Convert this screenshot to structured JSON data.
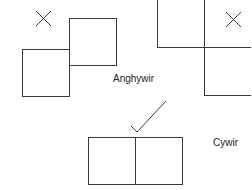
{
  "labels": {
    "incorrect": "Anghywir",
    "correct": "Cywir"
  },
  "colors": {
    "stroke": "#3a3a3a",
    "text": "#222222",
    "background": "#ffffff"
  },
  "examples": [
    {
      "name": "incorrect-left",
      "marker": "cross-icon",
      "arrangement": "two squares offset diagonally, touching at corner edge (lower-left, upper-right)"
    },
    {
      "name": "incorrect-right",
      "marker": "cross-icon",
      "arrangement": "two squares offset diagonally (upper-left, lower-right)"
    },
    {
      "name": "correct",
      "marker": "check-icon",
      "arrangement": "two squares side by side sharing a full edge"
    }
  ]
}
